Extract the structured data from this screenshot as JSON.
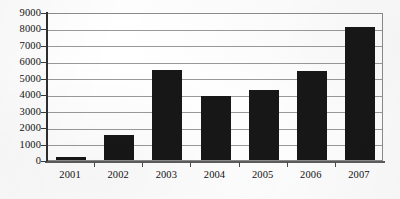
{
  "chart_data": {
    "type": "bar",
    "title": "",
    "subtitle": "",
    "xlabel": "",
    "ylabel": "",
    "categories": [
      "2001",
      "2002",
      "2003",
      "2004",
      "2005",
      "2006",
      "2007"
    ],
    "values": [
      200,
      1550,
      5450,
      3900,
      4250,
      5400,
      8100
    ],
    "series": [
      {
        "name": "",
        "values": [
          200,
          1550,
          5450,
          3900,
          4250,
          5400,
          8100
        ]
      }
    ],
    "ylim": [
      0,
      9000
    ],
    "ytick_step": 1000,
    "ytick_labels": [
      "0",
      "1000",
      "2000",
      "3000",
      "4000",
      "5000",
      "6000",
      "7000",
      "8000",
      "9000"
    ],
    "xtick_labels": [
      "2001",
      "2002",
      "2003",
      "2004",
      "2005",
      "2006",
      "2007"
    ],
    "grid": true,
    "grid_axis": "y",
    "legend": false,
    "legend_position": "none",
    "bar_color": "#171717",
    "gridline_color": "#9a9a9a",
    "axis_color": "#2e2e2e",
    "plot_background": "#ffffff",
    "annotations": []
  }
}
